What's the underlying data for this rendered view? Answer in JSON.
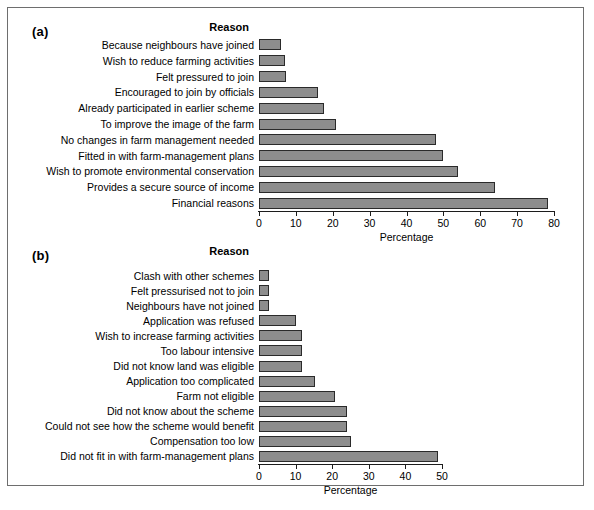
{
  "figure": {
    "bar_color": "#8d8d8d",
    "bar_border_color": "#2a2a2a",
    "frame_color": "#6e6e6e",
    "background": "#ffffff"
  },
  "panel_a": {
    "tag": "(a)",
    "reason_heading": "Reason"
  },
  "panel_b": {
    "tag": "(b)",
    "reason_heading": "Reason"
  },
  "chart_data": [
    {
      "type": "bar",
      "orientation": "horizontal",
      "panel": "(a)",
      "title": "",
      "xlabel": "Percentage",
      "ylabel": "Reason",
      "xlim": [
        0,
        80
      ],
      "xticks": [
        0,
        10,
        20,
        30,
        40,
        50,
        60,
        70,
        80
      ],
      "grid": false,
      "legend": "none",
      "categories": [
        "Because neighbours have joined",
        "Wish to reduce farming activities",
        "Felt pressured to join",
        "Encouraged to join by officials",
        "Already participated in earlier scheme",
        "To improve the image of the farm",
        "No changes in farm management needed",
        "Fitted in with farm-management plans",
        "Wish to promote environmental conservation",
        "Provides a secure source of income",
        "Financial reasons"
      ],
      "values": [
        6,
        7,
        7.2,
        16,
        17.5,
        21,
        48,
        50,
        54,
        64,
        78.5
      ]
    },
    {
      "type": "bar",
      "orientation": "horizontal",
      "panel": "(b)",
      "title": "",
      "xlabel": "Percentage",
      "ylabel": "Reason",
      "xlim": [
        0,
        50
      ],
      "xticks": [
        0,
        10,
        20,
        30,
        40,
        50
      ],
      "grid": false,
      "legend": "none",
      "categories": [
        "Clash with other schemes",
        "Felt pressurised not to join",
        "Neighbours have not joined",
        "Application was refused",
        "Wish to increase farming activities",
        "Too labour intensive",
        "Did not know land was eligible",
        "Application too complicated",
        "Farm not eligible",
        "Did not know about the scheme",
        "Could not see how the scheme would benefit",
        "Compensation too low",
        "Did not fit in with farm-management plans"
      ],
      "values": [
        2.8,
        2.8,
        2.8,
        10,
        11.7,
        11.7,
        11.8,
        15.3,
        20.8,
        24,
        24,
        25,
        49
      ]
    }
  ]
}
